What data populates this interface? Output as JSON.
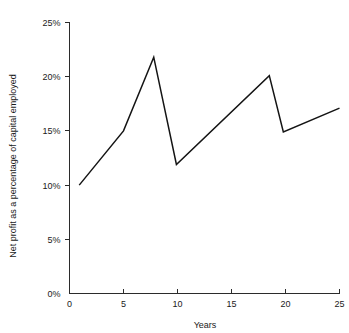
{
  "chart_data": {
    "type": "line",
    "title": "",
    "subtitle": "",
    "xlabel": "Years",
    "ylabel": "Net profit as a percentage of capital employed",
    "xlim": [
      0,
      25
    ],
    "ylim": [
      0,
      25
    ],
    "grid": false,
    "legend": null,
    "legend_position": "none",
    "x_ticks": [
      0,
      5,
      10,
      15,
      20,
      25
    ],
    "x_tick_labels": [
      "0",
      "5",
      "10",
      "15",
      "20",
      "25"
    ],
    "y_ticks": [
      0,
      5,
      10,
      15,
      20,
      25
    ],
    "y_tick_labels": [
      "0%",
      "5%",
      "10%",
      "15%",
      "20%",
      "25%"
    ],
    "line_color": "#141414",
    "axis_color": "#2b2b2b",
    "background_color": "#ffffff",
    "series": [
      {
        "name": "Net profit as a percentage of capital employed",
        "x": [
          0.9,
          5.0,
          7.8,
          9.9,
          18.5,
          19.8,
          25.0
        ],
        "values": [
          10.0,
          15.0,
          21.8,
          11.9,
          20.1,
          14.9,
          17.1
        ],
        "points": [
          {
            "x": 0.9,
            "y": 10.0
          },
          {
            "x": 5.0,
            "y": 15.0
          },
          {
            "x": 7.8,
            "y": 21.8
          },
          {
            "x": 9.9,
            "y": 11.9
          },
          {
            "x": 18.5,
            "y": 20.1
          },
          {
            "x": 19.8,
            "y": 14.9
          },
          {
            "x": 25.0,
            "y": 17.1
          }
        ]
      }
    ]
  }
}
